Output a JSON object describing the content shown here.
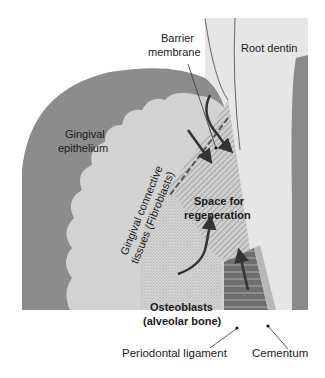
{
  "labels": {
    "barrier_membrane_1": "Barrier",
    "barrier_membrane_2": "membrane",
    "root_dentin": "Root dentin",
    "gingival_epithelium_1": "Gingival",
    "gingival_epithelium_2": "epithelium",
    "gingival_connective_1": "Gingival connective",
    "gingival_connective_2": "tissues (Fibroblasts)",
    "space_1": "Space for",
    "space_2": "regeneration",
    "osteoblasts_1": "Osteoblasts",
    "osteoblasts_2": "(alveolar bone)",
    "periodontal_ligament": "Periodontal ligament",
    "cementum": "Cementum"
  },
  "colors": {
    "epithelium": "#8c8c8c",
    "connective": "#d2d2d2",
    "dentin": "#e4e4e4",
    "regeneration": "#c4c4c4",
    "bone": "#cfcfcf",
    "ligament": "#6e6e6e",
    "cementum": "#b8b8b8",
    "arrow": "#333333"
  }
}
